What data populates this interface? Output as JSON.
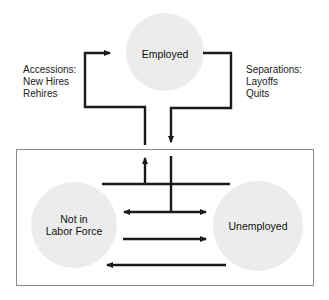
{
  "diagram": {
    "nodes": {
      "employed": {
        "label": "Employed"
      },
      "not_in_labor_force": {
        "label_line1": "Not in",
        "label_line2": "Labor Force"
      },
      "unemployed": {
        "label": "Unemployed"
      }
    },
    "annotations": {
      "accessions": {
        "title": "Accessions:",
        "items": [
          "New Hires",
          "Rehires"
        ]
      },
      "separations": {
        "title": "Separations:",
        "items": [
          "Layoffs",
          "Quits"
        ]
      }
    },
    "colors": {
      "circle_fill": "#ebebeb",
      "arrow": "#1a1a1a",
      "box_border": "#8a8a8a"
    }
  }
}
